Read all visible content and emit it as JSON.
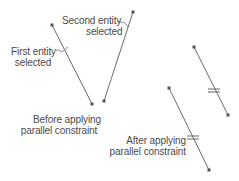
{
  "colors": {
    "line": "#6a6a6a",
    "endpoint": "#555555",
    "text": "#4a4a4a",
    "background": "#ffffff"
  },
  "labels": {
    "first_entity": {
      "line1": "First entity",
      "line2": "selected"
    },
    "second_entity": {
      "line1": "Second entity",
      "line2": "selected"
    },
    "before": {
      "line1": "Before applying",
      "line2": "parallel constraint"
    },
    "after": {
      "line1": "After applying",
      "line2": "parallel constraint"
    }
  },
  "entities": {
    "before": [
      {
        "name": "first-entity",
        "x1": 52,
        "y1": 25,
        "x2": 92,
        "y2": 104
      },
      {
        "name": "second-entity",
        "x1": 133,
        "y1": 12,
        "x2": 104,
        "y2": 101
      }
    ],
    "after": [
      {
        "name": "upper-parallel-line",
        "x1": 194,
        "y1": 47,
        "x2": 228,
        "y2": 115,
        "symbol": {
          "x": 214,
          "y": 90
        }
      },
      {
        "name": "lower-parallel-line",
        "x1": 169,
        "y1": 88,
        "x2": 209,
        "y2": 170,
        "symbol": {
          "x": 193,
          "y": 137
        }
      }
    ]
  },
  "symbols": {
    "parallel": "parallel-constraint-glyph"
  }
}
